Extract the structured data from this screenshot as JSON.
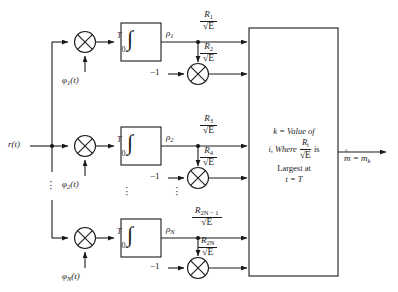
{
  "figure": {
    "input_label": "r(t)",
    "output_label": "m̂ = m",
    "output_sub": "k",
    "stroke_color": "#1a1a1a",
    "background": "#ffffff"
  },
  "branches": [
    {
      "basis_label": "φ",
      "basis_sub": "1",
      "basis_arg": "(t)",
      "integrator": {
        "symbol": "∫",
        "upper": "T",
        "lower": "0"
      },
      "rho_label": "ρ",
      "rho_sub": "1",
      "gain_label": "−1",
      "out_top": {
        "num": "R",
        "num_sub": "1",
        "den": "√E"
      },
      "out_bottom": {
        "num": "R",
        "num_sub": "2",
        "den": "√E"
      }
    },
    {
      "basis_label": "φ",
      "basis_sub": "2",
      "basis_arg": "(t)",
      "integrator": {
        "symbol": "∫",
        "upper": "T",
        "lower": "0"
      },
      "rho_label": "ρ",
      "rho_sub": "2",
      "gain_label": "−1",
      "out_top": {
        "num": "R",
        "num_sub": "3",
        "den": "√E"
      },
      "out_bottom": {
        "num": "R",
        "num_sub": "4",
        "den": "√E"
      }
    },
    {
      "basis_label": "φ",
      "basis_sub": "N",
      "basis_arg": "(t)",
      "integrator": {
        "symbol": "∫",
        "upper": "T",
        "lower": "0"
      },
      "rho_label": "ρ",
      "rho_sub": "N",
      "gain_label": "−1",
      "out_top": {
        "num": "R",
        "num_sub": "2N − 1",
        "den": "√E"
      },
      "out_bottom": {
        "num": "R",
        "num_sub": "2N",
        "den": "√E"
      }
    }
  ],
  "decision_box": {
    "line1": "k = Value of",
    "line2_prefix": "i, Where",
    "line2_frac_num": "R",
    "line2_frac_num_sub": "i",
    "line2_frac_den": "√E",
    "line2_suffix": "is",
    "line3": "Largest at",
    "line4": "t = T"
  },
  "ellipsis": {
    "glyph": "·",
    "count": 3
  }
}
